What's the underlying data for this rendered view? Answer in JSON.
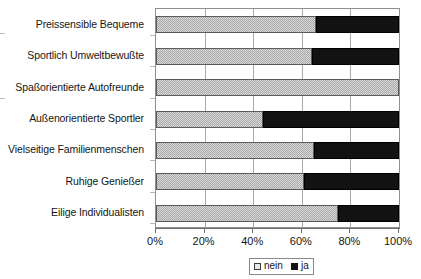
{
  "chart_data": {
    "type": "bar",
    "orientation": "horizontal",
    "stacked": true,
    "stack_mode": "percent",
    "title": "",
    "subtitle": "",
    "xlabel": "",
    "ylabel": "",
    "xlim": [
      0,
      100
    ],
    "grid": true,
    "grid_axis": "x",
    "legend_position": "bottom-center",
    "categories": [
      "Preissensible Bequeme",
      "Sportlich Umweltbewußte",
      "Spaßorientierte Autofreunde",
      "Außenorientierte Sportler",
      "Vielseitige Familienmenschen",
      "Ruhige Genießer",
      "Eilige Individualisten"
    ],
    "series": [
      {
        "name": "nein",
        "color": "#a9a9a9",
        "values": [
          66,
          64,
          100,
          44,
          65,
          61,
          75
        ]
      },
      {
        "name": "ja",
        "color": "#121212",
        "values": [
          34,
          36,
          0,
          56,
          35,
          39,
          25
        ]
      }
    ],
    "xticks": [
      0,
      20,
      40,
      60,
      80,
      100
    ],
    "xticklabels": [
      "0%",
      "20%",
      "40%",
      "60%",
      "80%",
      "100%"
    ]
  },
  "legend": {
    "entries": [
      {
        "label": "nein",
        "swatch": "swatch-nein-icon"
      },
      {
        "label": "ja",
        "swatch": "swatch-ja-icon"
      }
    ]
  }
}
